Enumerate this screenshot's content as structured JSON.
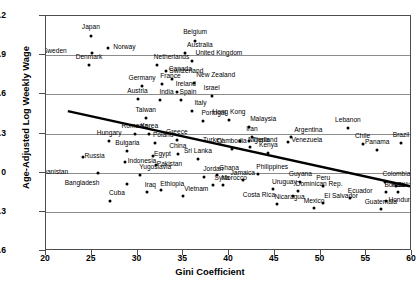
{
  "chart_data": {
    "type": "scatter",
    "title": "",
    "xlabel": "Gini Coefficient",
    "ylabel": "Age-Adjusted Log Weekly Wage",
    "xlim": [
      20,
      60
    ],
    "ylim": [
      -0.6,
      1.2
    ],
    "xticks": [
      20,
      25,
      30,
      35,
      40,
      45,
      50,
      55,
      60
    ],
    "yticks": [
      -0.6,
      -0.3,
      0,
      0.3,
      0.6,
      0.9,
      1.2
    ],
    "ytick_labels": [
      "−0.6",
      "−0.3",
      "0",
      "0.3",
      "0.6",
      "0.9",
      "1.2"
    ],
    "grid": "horizontal",
    "legend": "none",
    "point_color": "#000000",
    "trendline": {
      "type": "linear-fit",
      "color": "#000000",
      "x_start": 22.4,
      "y_start": 0.465,
      "x_end": 60.0,
      "y_end": -0.115
    },
    "points": [
      {
        "label": "Japan",
        "x": 24.9,
        "y": 1.045,
        "lx": 0,
        "ly": -9
      },
      {
        "label": "Norway",
        "x": 26.8,
        "y": 0.955,
        "lx": 5,
        "ly": -1
      },
      {
        "label": "Sweden",
        "x": 25.0,
        "y": 0.915,
        "lx": -25,
        "ly": -2
      },
      {
        "label": "Denmark",
        "x": 24.7,
        "y": 0.825,
        "lx": 0,
        "ly": -8
      },
      {
        "label": "Belgium",
        "x": 36.3,
        "y": 1.01,
        "lx": 0,
        "ly": -9
      },
      {
        "label": "Australia",
        "x": 35.2,
        "y": 0.915,
        "lx": 2,
        "ly": -8
      },
      {
        "label": "United Kingdom",
        "x": 36.0,
        "y": 0.855,
        "lx": 3,
        "ly": -8
      },
      {
        "label": "Netherlands",
        "x": 32.1,
        "y": 0.825,
        "lx": -3,
        "ly": -8
      },
      {
        "label": "Canada",
        "x": 33.1,
        "y": 0.78,
        "lx": 3,
        "ly": -2
      },
      {
        "label": "Switzerland",
        "x": 33.8,
        "y": 0.715,
        "lx": -3,
        "ly": -8
      },
      {
        "label": "New Zealand",
        "x": 36.2,
        "y": 0.69,
        "lx": 2,
        "ly": -8
      },
      {
        "label": "Germany",
        "x": 30.5,
        "y": 0.665,
        "lx": 0,
        "ly": -8
      },
      {
        "label": "France",
        "x": 32.7,
        "y": 0.68,
        "lx": -2,
        "ly": -8
      },
      {
        "label": "Austria",
        "x": 30.0,
        "y": 0.565,
        "lx": 0,
        "ly": -8
      },
      {
        "label": "Ireland",
        "x": 34.3,
        "y": 0.615,
        "lx": -1,
        "ly": -8
      },
      {
        "label": "India",
        "x": 32.5,
        "y": 0.56,
        "lx": -1,
        "ly": -8
      },
      {
        "label": "Spain",
        "x": 34.7,
        "y": 0.555,
        "lx": -1,
        "ly": -8
      },
      {
        "label": "Israel",
        "x": 38.1,
        "y": 0.585,
        "lx": 0,
        "ly": -8
      },
      {
        "label": "Italy",
        "x": 36.0,
        "y": 0.475,
        "lx": 2,
        "ly": -8
      },
      {
        "label": "Taiwan",
        "x": 30.9,
        "y": 0.42,
        "lx": 0,
        "ly": -8
      },
      {
        "label": "Portugal",
        "x": 37.2,
        "y": 0.395,
        "lx": -2,
        "ly": -8
      },
      {
        "label": "Hong Kong",
        "x": 40.0,
        "y": 0.405,
        "lx": 0,
        "ly": -8
      },
      {
        "label": "Malaysia",
        "x": 42.2,
        "y": 0.35,
        "lx": 1,
        "ly": -8
      },
      {
        "label": "Lebanon",
        "x": 53.0,
        "y": 0.345,
        "lx": 0,
        "ly": -8
      },
      {
        "label": "Argentina",
        "x": 46.8,
        "y": 0.275,
        "lx": 3,
        "ly": -7
      },
      {
        "label": "Iran",
        "x": 42.5,
        "y": 0.27,
        "lx": 0,
        "ly": -8
      },
      {
        "label": "Venezuela",
        "x": 46.5,
        "y": 0.235,
        "lx": 3,
        "ly": -2
      },
      {
        "label": "Chile",
        "x": 54.6,
        "y": 0.22,
        "lx": 0,
        "ly": -8
      },
      {
        "label": "Brazil",
        "x": 58.8,
        "y": 0.225,
        "lx": 0,
        "ly": -8
      },
      {
        "label": "Panama",
        "x": 56.2,
        "y": 0.17,
        "lx": 0,
        "ly": -8
      },
      {
        "label": "Turkey",
        "x": 41.2,
        "y": 0.245,
        "lx": -17,
        "ly": -1
      },
      {
        "label": "Thailand",
        "x": 42.2,
        "y": 0.245,
        "lx": 3,
        "ly": -1
      },
      {
        "label": "Nigeria",
        "x": 42.3,
        "y": 0.195,
        "lx": -2,
        "ly": -7
      },
      {
        "label": "Kenya",
        "x": 44.3,
        "y": 0.15,
        "lx": 0,
        "ly": -8
      },
      {
        "label": "Cambodia",
        "x": 40.3,
        "y": 0.185,
        "lx": 0,
        "ly": -8
      },
      {
        "label": "Hungary",
        "x": 26.9,
        "y": 0.245,
        "lx": 0,
        "ly": -8
      },
      {
        "label": "Romania",
        "x": 29.7,
        "y": 0.295,
        "lx": 0,
        "ly": -8
      },
      {
        "label": "Korea",
        "x": 31.3,
        "y": 0.295,
        "lx": 0,
        "ly": -8
      },
      {
        "label": "Poland",
        "x": 31.9,
        "y": 0.225,
        "lx": -2,
        "ly": -8
      },
      {
        "label": "Greece",
        "x": 34.3,
        "y": 0.25,
        "lx": 0,
        "ly": -8
      },
      {
        "label": "Bulgaria",
        "x": 28.9,
        "y": 0.165,
        "lx": 0,
        "ly": -8
      },
      {
        "label": "Russia",
        "x": 24.0,
        "y": 0.12,
        "lx": 2,
        "ly": -1
      },
      {
        "label": "Egypt",
        "x": 31.7,
        "y": 0.13,
        "lx": 1,
        "ly": -2
      },
      {
        "label": "China",
        "x": 34.4,
        "y": 0.14,
        "lx": 0,
        "ly": -8
      },
      {
        "label": "Indonesia",
        "x": 28.6,
        "y": 0.085,
        "lx": 3,
        "ly": -1
      },
      {
        "label": "Sri Lanka",
        "x": 36.6,
        "y": 0.105,
        "lx": 0,
        "ly": -8
      },
      {
        "label": "Pakistan",
        "x": 32.0,
        "y": 0.06,
        "lx": 1,
        "ly": -1
      },
      {
        "label": "Afghanistan",
        "x": 25.7,
        "y": 0.0,
        "lx": -30,
        "ly": -1
      },
      {
        "label": "Yugoslavia",
        "x": 30.3,
        "y": -0.015,
        "lx": -1,
        "ly": -8
      },
      {
        "label": "Bangladesh",
        "x": 28.8,
        "y": -0.085,
        "lx": -27,
        "ly": -1
      },
      {
        "label": "Cuba",
        "x": 27.0,
        "y": -0.215,
        "lx": -1,
        "ly": -8
      },
      {
        "label": "Iraq",
        "x": 31.0,
        "y": -0.15,
        "lx": -2,
        "ly": -7
      },
      {
        "label": "Ethiopia",
        "x": 32.6,
        "y": -0.13,
        "lx": -1,
        "ly": -6
      },
      {
        "label": "Jordan",
        "x": 37.3,
        "y": -0.03,
        "lx": -1,
        "ly": -8
      },
      {
        "label": "Syria",
        "x": 38.2,
        "y": -0.095,
        "lx": 2,
        "ly": -7
      },
      {
        "label": "Vietnam",
        "x": 35.0,
        "y": -0.175,
        "lx": 1,
        "ly": -7
      },
      {
        "label": "Ghana",
        "x": 38.7,
        "y": -0.02,
        "lx": 2,
        "ly": -7
      },
      {
        "label": "Morocco",
        "x": 39.3,
        "y": -0.095,
        "lx": -1,
        "ly": -7
      },
      {
        "label": "Philippines",
        "x": 43.2,
        "y": -0.01,
        "lx": -2,
        "ly": -7
      },
      {
        "label": "Jamaica",
        "x": 41.5,
        "y": -0.055,
        "lx": 0,
        "ly": -7
      },
      {
        "label": "Guyana",
        "x": 47.8,
        "y": -0.07,
        "lx": 0,
        "ly": -8
      },
      {
        "label": "Uruguay",
        "x": 44.8,
        "y": -0.125,
        "lx": -1,
        "ly": -7
      },
      {
        "label": "Dominican Rep.",
        "x": 47.5,
        "y": -0.14,
        "lx": -2,
        "ly": -7
      },
      {
        "label": "Costa Rica",
        "x": 47.0,
        "y": -0.175,
        "lx": -18,
        "ly": -1
      },
      {
        "label": "Nicaragua",
        "x": 45.2,
        "y": -0.24,
        "lx": -2,
        "ly": -7
      },
      {
        "label": "Mexico",
        "x": 49.3,
        "y": -0.27,
        "lx": 0,
        "ly": -7
      },
      {
        "label": "El Salvador",
        "x": 50.3,
        "y": -0.235,
        "lx": 1,
        "ly": -7
      },
      {
        "label": "Peru",
        "x": 50.3,
        "y": -0.105,
        "lx": 0,
        "ly": -8
      },
      {
        "label": "Colombia",
        "x": 57.0,
        "y": -0.075,
        "lx": -2,
        "ly": -8
      },
      {
        "label": "Belize",
        "x": 58.2,
        "y": -0.1,
        "lx": 2,
        "ly": -1
      },
      {
        "label": "Bolivia",
        "x": 57.2,
        "y": -0.15,
        "lx": -2,
        "ly": -7
      },
      {
        "label": "Haiti",
        "x": 58.5,
        "y": -0.145,
        "lx": 0,
        "ly": -7
      },
      {
        "label": "Ecuador",
        "x": 53.2,
        "y": -0.195,
        "lx": -2,
        "ly": -7
      },
      {
        "label": "Honduras",
        "x": 57.2,
        "y": -0.215,
        "lx": 2,
        "ly": -1
      },
      {
        "label": "Guatemala",
        "x": 56.6,
        "y": -0.275,
        "lx": 0,
        "ly": -7
      }
    ]
  }
}
